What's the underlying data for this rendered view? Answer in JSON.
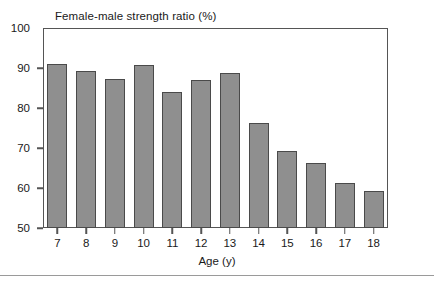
{
  "chart_data": {
    "type": "bar",
    "title": "Female-male strength ratio (%)",
    "xlabel": "Age (y)",
    "ylabel": "",
    "categories": [
      "7",
      "8",
      "9",
      "10",
      "11",
      "12",
      "13",
      "14",
      "15",
      "16",
      "17",
      "18"
    ],
    "values": [
      91.1,
      89.2,
      87.2,
      90.7,
      84.1,
      86.9,
      88.7,
      76.2,
      69.2,
      66.2,
      61.2,
      59.3
    ],
    "ylim": [
      50,
      100
    ],
    "yticks": [
      "100",
      "90",
      "80",
      "70",
      "60",
      "50"
    ],
    "ytick_values": [
      100,
      90,
      80,
      70,
      60,
      50
    ],
    "grid": false,
    "legend": false,
    "bar_fill_color": "#8f8f8f",
    "bar_edge_color": "#4a4a4a",
    "axis_color": "#555555",
    "background_color": "#ffffff"
  }
}
